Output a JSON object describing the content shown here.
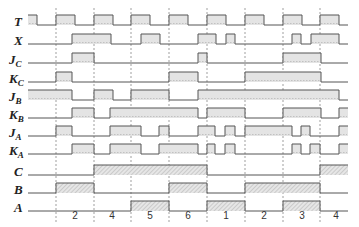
{
  "diagram": {
    "type": "timing-diagram",
    "x_start": 28,
    "x_end": 348,
    "pulse_height": 10,
    "colors": {
      "line": "#555555",
      "fill_light": "#e4e4e4",
      "fill_hatch": "#cfcfcf",
      "grid": "#777777",
      "text": "#222222"
    },
    "grid_lines_x": [
      56,
      94,
      131,
      169,
      207,
      245,
      283,
      320
    ],
    "state_labels": [
      {
        "x": 75,
        "text": "2"
      },
      {
        "x": 112,
        "text": "4"
      },
      {
        "x": 150,
        "text": "5"
      },
      {
        "x": 188,
        "text": "6"
      },
      {
        "x": 226,
        "text": "1"
      },
      {
        "x": 264,
        "text": "2"
      },
      {
        "x": 302,
        "text": "3"
      },
      {
        "x": 336,
        "text": "4"
      }
    ],
    "signals": [
      {
        "name": "T",
        "main": "T",
        "sub": "",
        "baseline": 25,
        "hatch": false,
        "high": [
          [
            28,
            37
          ],
          [
            56,
            75
          ],
          [
            94,
            113
          ],
          [
            131,
            150
          ],
          [
            169,
            188
          ],
          [
            207,
            226
          ],
          [
            245,
            264
          ],
          [
            283,
            302
          ],
          [
            320,
            339
          ]
        ]
      },
      {
        "name": "X",
        "main": "X",
        "sub": "",
        "baseline": 44,
        "hatch": false,
        "high": [
          [
            72,
            111
          ],
          [
            141,
            160
          ],
          [
            198,
            216
          ],
          [
            226,
            235
          ],
          [
            292,
            301
          ],
          [
            311,
            339
          ]
        ]
      },
      {
        "name": "Jc",
        "main": "J",
        "sub": "C",
        "baseline": 63,
        "hatch": false,
        "high": [
          [
            72,
            94
          ],
          [
            198,
            207
          ],
          [
            283,
            321
          ]
        ]
      },
      {
        "name": "Kc",
        "main": "K",
        "sub": "C",
        "baseline": 82,
        "hatch": false,
        "high": [
          [
            56,
            72
          ],
          [
            169,
            198
          ],
          [
            245,
            321
          ]
        ]
      },
      {
        "name": "JB",
        "main": "J",
        "sub": "B",
        "baseline": 100,
        "hatch": false,
        "high": [
          [
            28,
            72
          ],
          [
            94,
            113
          ],
          [
            131,
            169
          ],
          [
            198,
            339
          ]
        ]
      },
      {
        "name": "KB",
        "main": "K",
        "sub": "B",
        "baseline": 118,
        "hatch": false,
        "high": [
          [
            72,
            94
          ],
          [
            110,
            198
          ],
          [
            207,
            245
          ],
          [
            283,
            321
          ],
          [
            339,
            348
          ]
        ]
      },
      {
        "name": "JA",
        "main": "J",
        "sub": "A",
        "baseline": 136,
        "hatch": false,
        "high": [
          [
            56,
            72
          ],
          [
            110,
            141
          ],
          [
            159,
            169
          ],
          [
            198,
            215
          ],
          [
            225,
            235
          ],
          [
            245,
            292
          ],
          [
            301,
            310
          ],
          [
            339,
            348
          ]
        ]
      },
      {
        "name": "KA",
        "main": "K",
        "sub": "A",
        "baseline": 154,
        "hatch": false,
        "high": [
          [
            72,
            94
          ],
          [
            110,
            141
          ],
          [
            159,
            198
          ],
          [
            207,
            215
          ],
          [
            225,
            235
          ],
          [
            292,
            301
          ],
          [
            310,
            320
          ],
          [
            339,
            348
          ]
        ]
      },
      {
        "name": "C",
        "main": "C",
        "sub": "",
        "baseline": 175,
        "hatch": true,
        "high": [
          [
            94,
            207
          ],
          [
            320,
            348
          ]
        ]
      },
      {
        "name": "B",
        "main": "B",
        "sub": "",
        "baseline": 193,
        "hatch": true,
        "high": [
          [
            56,
            94
          ],
          [
            169,
            207
          ],
          [
            245,
            320
          ]
        ]
      },
      {
        "name": "A",
        "main": "A",
        "sub": "",
        "baseline": 211,
        "hatch": true,
        "high": [
          [
            131,
            169
          ],
          [
            207,
            245
          ],
          [
            283,
            320
          ]
        ]
      }
    ]
  }
}
